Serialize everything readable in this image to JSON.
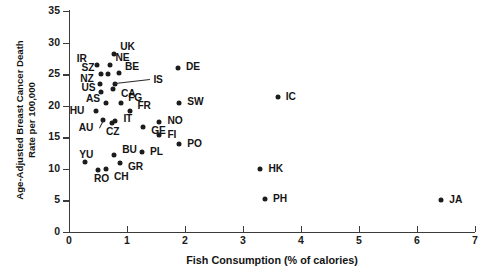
{
  "chart_data": {
    "type": "scatter",
    "title": "",
    "xlabel": "Fish Consumption (% of calories)",
    "ylabel_line1": "Age-Adjusted Breast Cancer Death",
    "ylabel_line2": "Rate per 100,000",
    "xlim": [
      0,
      7
    ],
    "ylim": [
      0,
      35
    ],
    "xticks": [
      0,
      1,
      2,
      3,
      4,
      5,
      6,
      7
    ],
    "yticks": [
      0,
      5,
      10,
      15,
      20,
      25,
      30,
      35
    ],
    "grid": false,
    "legend": "none",
    "marker_color": "#1c1c1c",
    "axis_color": "#3b3b3b",
    "points": [
      {
        "label": "UK",
        "x": 0.78,
        "y": 28.2,
        "lx": 6,
        "ly": -13
      },
      {
        "label": "IR",
        "x": 0.48,
        "y": 26.4,
        "lx": -20,
        "ly": -12
      },
      {
        "label": "NE",
        "x": 0.7,
        "y": 26.4,
        "lx": 6,
        "ly": -13
      },
      {
        "label": "BE",
        "x": 0.86,
        "y": 25.2,
        "lx": 6,
        "ly": -12
      },
      {
        "label": "SZ",
        "x": 0.56,
        "y": 25.0,
        "lx": -20,
        "ly": -12
      },
      {
        "label": "DK",
        "x": 0.68,
        "y": 25.0,
        "lx": 0,
        "ly": 0,
        "hide": true
      },
      {
        "label": "NZ",
        "x": 0.54,
        "y": 23.5,
        "lx": -20,
        "ly": -11
      },
      {
        "label": "IS",
        "x": 0.8,
        "y": 23.5,
        "lx": 38,
        "ly": -10,
        "leader": true
      },
      {
        "label": "CA",
        "x": 0.76,
        "y": 22.6,
        "lx": 8,
        "ly": -1
      },
      {
        "label": "US",
        "x": 0.56,
        "y": 22.1,
        "lx": -20,
        "ly": -10
      },
      {
        "label": "AS",
        "x": 0.64,
        "y": 20.4,
        "lx": -20,
        "ly": -10
      },
      {
        "label": "FG",
        "x": 0.9,
        "y": 20.4,
        "lx": 7,
        "ly": -11
      },
      {
        "label": "FR",
        "x": 1.06,
        "y": 19.2,
        "lx": 7,
        "ly": -11
      },
      {
        "label": "HU",
        "x": 0.46,
        "y": 19.2,
        "lx": -26,
        "ly": -6
      },
      {
        "label": "AU",
        "x": 0.58,
        "y": 17.8,
        "lx": -24,
        "ly": 2,
        "leader": true
      },
      {
        "label": "CZ",
        "x": 0.74,
        "y": 17.2,
        "lx": -6,
        "ly": 3
      },
      {
        "label": "IT",
        "x": 0.8,
        "y": 17.6,
        "lx": 8,
        "ly": -8
      },
      {
        "label": "GE",
        "x": 1.28,
        "y": 16.6,
        "lx": 8,
        "ly": -2
      },
      {
        "label": "NO",
        "x": 1.56,
        "y": 17.4,
        "lx": 8,
        "ly": -7
      },
      {
        "label": "FI",
        "x": 1.56,
        "y": 15.4,
        "lx": 8,
        "ly": -6
      },
      {
        "label": "YU",
        "x": 0.28,
        "y": 11.1,
        "lx": -6,
        "ly": -13
      },
      {
        "label": "RO",
        "x": 0.5,
        "y": 9.8,
        "lx": -4,
        "ly": 3
      },
      {
        "label": "CH",
        "x": 0.64,
        "y": 10.0,
        "lx": 8,
        "ly": 2
      },
      {
        "label": "BU",
        "x": 0.78,
        "y": 12.2,
        "lx": 8,
        "ly": -11
      },
      {
        "label": "GR",
        "x": 0.88,
        "y": 11.0,
        "lx": 8,
        "ly": -2
      },
      {
        "label": "PL",
        "x": 1.26,
        "y": 12.6,
        "lx": 8,
        "ly": -6
      },
      {
        "label": "PO",
        "x": 1.9,
        "y": 14.0,
        "lx": 8,
        "ly": -6
      },
      {
        "label": "DE",
        "x": 1.88,
        "y": 26.0,
        "lx": 8,
        "ly": -7
      },
      {
        "label": "SW",
        "x": 1.9,
        "y": 20.5,
        "lx": 8,
        "ly": -7
      },
      {
        "label": "IC",
        "x": 3.6,
        "y": 21.4,
        "lx": 8,
        "ly": -6
      },
      {
        "label": "HK",
        "x": 3.3,
        "y": 10.0,
        "lx": 8,
        "ly": -6
      },
      {
        "label": "PH",
        "x": 3.38,
        "y": 5.2,
        "lx": 8,
        "ly": -6
      },
      {
        "label": "JA",
        "x": 6.42,
        "y": 5.0,
        "lx": 8,
        "ly": -6
      }
    ]
  }
}
